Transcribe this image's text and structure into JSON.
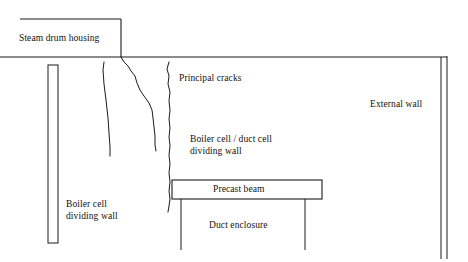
{
  "figure": {
    "kind": "engineering-section-diagram",
    "width": 468,
    "height": 262,
    "background_color": "#ffffff",
    "line_color": "#1a1a1a"
  },
  "labels": {
    "steam_drum_housing": "Steam drum housing",
    "principal_cracks": "Principal cracks",
    "external_wall": "External wall",
    "boiler_duct_dividing_wall": "Boiler cell / duct cell\ndividing wall",
    "precast_beam": "Precast beam",
    "boiler_cell_dividing_wall": "Boiler cell\ndividing wall",
    "duct_enclosure": "Duct enclosure"
  },
  "geometry": {
    "steam_drum_housing_box": {
      "top_line": {
        "x1": 20,
        "y1": 19,
        "x2": 121,
        "y2": 19
      },
      "right_line": {
        "x1": 121,
        "y1": 19,
        "x2": 121,
        "y2": 57
      }
    },
    "main_floor_line": {
      "x1": 0,
      "y1": 57,
      "x2": 447,
      "y2": 57
    },
    "external_wall": {
      "inner_line": {
        "x1": 441,
        "y1": 57,
        "x2": 441,
        "y2": 258
      },
      "outer_line": {
        "x1": 447,
        "y1": 55,
        "x2": 447,
        "y2": 258
      },
      "cap_line": {
        "x1": 441,
        "y1": 57,
        "x2": 447,
        "y2": 57
      }
    },
    "boiler_cell_dividing_wall": {
      "x_left": 48,
      "x_right": 58,
      "y_top": 65,
      "y_bottom": 243
    },
    "precast_beam_box": {
      "x": 172,
      "y": 180,
      "width": 150,
      "height": 19
    },
    "duct_enclosure_walls": {
      "left_line": {
        "x1": 181,
        "y1": 199,
        "x2": 181,
        "y2": 250
      },
      "right_line": {
        "x1": 305,
        "y1": 199,
        "x2": 305,
        "y2": 250
      }
    },
    "cracks": [
      {
        "name": "crack-left",
        "points": "104,62 103,70 104,84 106,100 108,118 109,133 110,147 110,156"
      },
      {
        "name": "crack-middle",
        "points": "121,57 124,62 128,66 131,71 135,76 137,83 140,90 144,96 149,103 152,110 153,118 154,127 155,136 155,145 156,151"
      },
      {
        "name": "crack-right",
        "points": "169,62 167,69 169,76 168,84 170,92 169,101 170,110 169,119 170,128 169,137 170,146 169,155 170,164 169,173 170,182 169,191 170,199 169,206 168,212"
      }
    ]
  }
}
